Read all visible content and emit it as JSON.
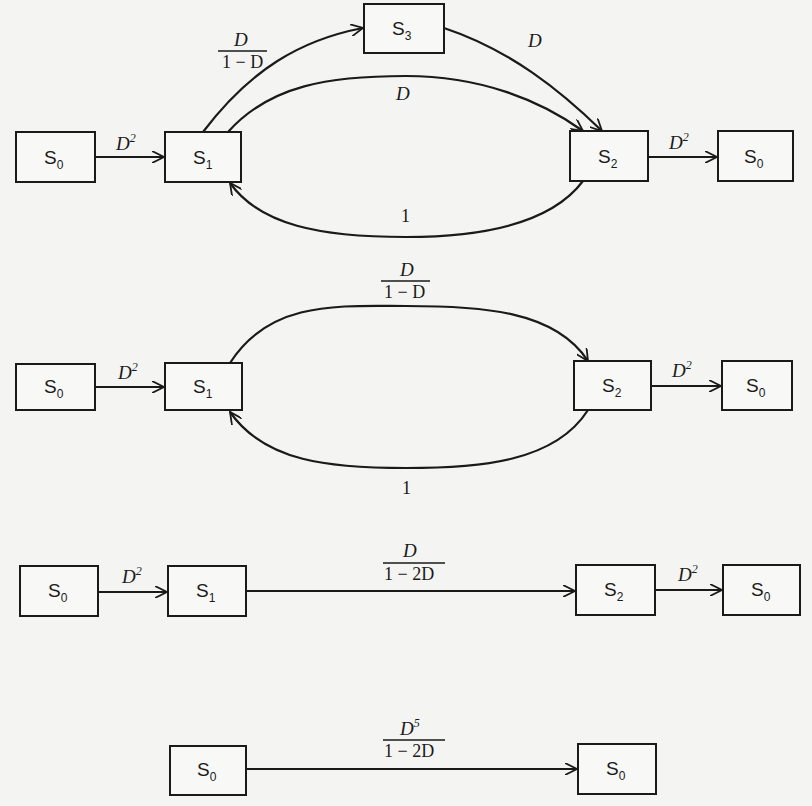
{
  "figure": {
    "colors": {
      "ink": "#1a1a1a",
      "background": "#f4f4f2"
    }
  },
  "diagrams": [
    {
      "id": "step1",
      "nodes": [
        {
          "id": "a",
          "label": "S",
          "sub": "0"
        },
        {
          "id": "b",
          "label": "S",
          "sub": "1"
        },
        {
          "id": "c",
          "label": "S",
          "sub": "3"
        },
        {
          "id": "d",
          "label": "S",
          "sub": "2"
        },
        {
          "id": "e",
          "label": "S",
          "sub": "0"
        }
      ],
      "edges": [
        {
          "from": "S0",
          "to": "S1",
          "gain": "D",
          "gain_sup": "2"
        },
        {
          "from": "S1",
          "to": "S3",
          "gain_num": "D",
          "gain_den": "1 − D"
        },
        {
          "from": "S3",
          "to": "S2",
          "gain": "D"
        },
        {
          "from": "S1",
          "to": "S2",
          "gain": "D"
        },
        {
          "from": "S2",
          "to": "S1",
          "gain": "1"
        },
        {
          "from": "S2",
          "to": "S0",
          "gain": "D",
          "gain_sup": "2"
        }
      ]
    },
    {
      "id": "step2",
      "nodes": [
        {
          "id": "a",
          "label": "S",
          "sub": "0"
        },
        {
          "id": "b",
          "label": "S",
          "sub": "1"
        },
        {
          "id": "d",
          "label": "S",
          "sub": "2"
        },
        {
          "id": "e",
          "label": "S",
          "sub": "0"
        }
      ],
      "edges": [
        {
          "from": "S0",
          "to": "S1",
          "gain": "D",
          "gain_sup": "2"
        },
        {
          "from": "S1",
          "to": "S2",
          "gain_num": "D",
          "gain_den": "1 − D"
        },
        {
          "from": "S2",
          "to": "S1",
          "gain": "1"
        },
        {
          "from": "S2",
          "to": "S0",
          "gain": "D",
          "gain_sup": "2"
        }
      ]
    },
    {
      "id": "step3",
      "nodes": [
        {
          "id": "a",
          "label": "S",
          "sub": "0"
        },
        {
          "id": "b",
          "label": "S",
          "sub": "1"
        },
        {
          "id": "d",
          "label": "S",
          "sub": "2"
        },
        {
          "id": "e",
          "label": "S",
          "sub": "0"
        }
      ],
      "edges": [
        {
          "from": "S0",
          "to": "S1",
          "gain": "D",
          "gain_sup": "2"
        },
        {
          "from": "S1",
          "to": "S2",
          "gain_num": "D",
          "gain_den": "1 − 2D"
        },
        {
          "from": "S2",
          "to": "S0",
          "gain": "D",
          "gain_sup": "2"
        }
      ]
    },
    {
      "id": "step4",
      "nodes": [
        {
          "id": "a",
          "label": "S",
          "sub": "0"
        },
        {
          "id": "e",
          "label": "S",
          "sub": "0"
        }
      ],
      "edges": [
        {
          "from": "S0",
          "to": "S0",
          "gain_num": "D",
          "gain_num_sup": "5",
          "gain_den": "1 − 2D"
        }
      ]
    }
  ]
}
